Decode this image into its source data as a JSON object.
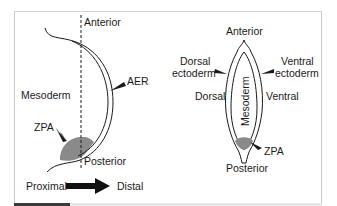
{
  "figure": {
    "left_panel": {
      "labels": {
        "anterior": "Anterior",
        "posterior": "Posterior",
        "mesoderm": "Mesoderm",
        "aer": "AER",
        "zpa": "ZPA"
      },
      "axis": {
        "proximal": "Proximal",
        "distal": "Distal"
      }
    },
    "right_panel": {
      "labels": {
        "anterior": "Anterior",
        "posterior": "Posterior",
        "dorsal_ectoderm_line1": "Dorsal",
        "dorsal_ectoderm_line2": "ectoderm",
        "ventral_ectoderm_line1": "Ventral",
        "ventral_ectoderm_line2": "ectoderm",
        "dorsal": "Dorsal",
        "ventral": "Ventral",
        "mesoderm": "Mesoderm",
        "zpa": "ZPA"
      }
    },
    "colors": {
      "stroke": "#1a1a1a",
      "zpa_fill": "#8a8a8a",
      "frame": "#c8c8c8",
      "progress": "#3a3a3a"
    }
  }
}
